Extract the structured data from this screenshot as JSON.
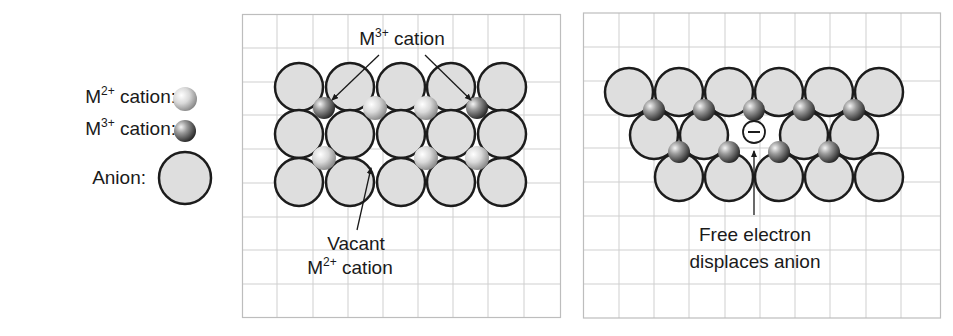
{
  "colors": {
    "grid": "#cfcfcf",
    "panel_border": "#bdbdbd",
    "anion_fill": "#dedede",
    "anion_stroke": "#1c1c1c",
    "text": "#1a1a1a"
  },
  "legend": {
    "items": [
      {
        "base": "M",
        "sup": "2+",
        "rest": " cation:",
        "symbol": "m2-cation"
      },
      {
        "base": "M",
        "sup": "3+",
        "rest": " cation:",
        "symbol": "m3-cation"
      },
      {
        "base": "Anion:",
        "sup": "",
        "rest": "",
        "symbol": "anion"
      }
    ]
  },
  "left_panel": {
    "label_top": {
      "base": "M",
      "sup": "3+",
      "rest": " cation"
    },
    "label_bottom_line1": "Vacant",
    "label_bottom_line2": {
      "base": "M",
      "sup": "2+",
      "rest": " cation"
    },
    "anion_rows": [
      {
        "y": 87,
        "x": [
          299,
          350,
          401,
          451,
          502
        ]
      },
      {
        "y": 134,
        "x": [
          299,
          350,
          401,
          451,
          502
        ]
      },
      {
        "y": 182,
        "x": [
          299,
          350,
          401,
          451,
          502
        ]
      }
    ],
    "cations": [
      {
        "x": 324,
        "y": 108,
        "type": "M3+"
      },
      {
        "x": 375,
        "y": 108,
        "type": "M2+"
      },
      {
        "x": 426,
        "y": 108,
        "type": "M2+"
      },
      {
        "x": 477,
        "y": 108,
        "type": "M3+"
      },
      {
        "x": 324,
        "y": 158,
        "type": "M2+"
      },
      {
        "x": 375,
        "y": 158,
        "type": "vacant"
      },
      {
        "x": 426,
        "y": 158,
        "type": "M2+"
      },
      {
        "x": 477,
        "y": 158,
        "type": "M2+"
      }
    ]
  },
  "right_panel": {
    "label_line1": "Free electron",
    "label_line2": "displaces anion",
    "electron_symbol": "−",
    "anion_rows": [
      {
        "y": 92,
        "x": [
          629,
          679,
          729,
          779,
          829,
          879
        ]
      },
      {
        "y": 135,
        "x": [
          654,
          704,
          804,
          854
        ]
      },
      {
        "y": 177,
        "x": [
          679,
          729,
          779,
          829,
          879
        ]
      }
    ],
    "cations": [
      {
        "x": 654,
        "y": 110,
        "type": "M3+"
      },
      {
        "x": 704,
        "y": 110,
        "type": "M3+"
      },
      {
        "x": 754,
        "y": 110,
        "type": "M3+"
      },
      {
        "x": 804,
        "y": 110,
        "type": "M3+"
      },
      {
        "x": 854,
        "y": 110,
        "type": "M3+"
      },
      {
        "x": 679,
        "y": 152,
        "type": "M3+"
      },
      {
        "x": 729,
        "y": 152,
        "type": "M3+"
      },
      {
        "x": 779,
        "y": 152,
        "type": "M3+"
      },
      {
        "x": 829,
        "y": 152,
        "type": "M3+"
      }
    ],
    "electron": {
      "x": 754,
      "y": 132
    }
  }
}
